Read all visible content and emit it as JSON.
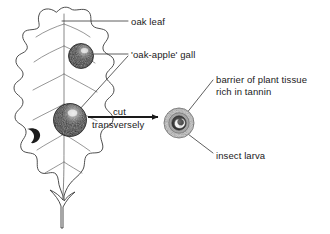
{
  "diagram": {
    "type": "biology-labelled-diagram",
    "background_color": "#ffffff",
    "ink_color": "#1a1a1a"
  },
  "labels": {
    "oak_leaf": "oak leaf",
    "gall": "'oak-apple' gall",
    "barrier_line1": "barrier of plant tissue",
    "barrier_line2": "rich in tannin",
    "insect_larva": "insect larva",
    "cut": "cut",
    "transversely": "transversely"
  },
  "parts": {
    "leaf": {
      "name": "oak leaf",
      "outline_color": "#3a3a3a",
      "fill_color": "#ffffff",
      "vein_color": "#6a6a6a",
      "lobe_count": 6
    },
    "gall_upper": {
      "name": "oak-apple gall (upper)",
      "center_x": 81,
      "center_y": 56,
      "radius": 12,
      "fill_color": "#1c1c1c",
      "highlight_color": "#f0f0f0"
    },
    "gall_lower": {
      "name": "oak-apple gall (lower)",
      "center_x": 70,
      "center_y": 120,
      "radius": 16,
      "fill_color": "#1c1c1c",
      "highlight_color": "#f2f2f2"
    },
    "leaf_blemish": {
      "name": "dark blemish on lower-left lobe",
      "fill_color": "#1c1c1c"
    },
    "cross_section": {
      "name": "transverse section of gall",
      "center_x": 179,
      "center_y": 123,
      "outer_radius": 15,
      "outer_ring_color": "#d2d2d2",
      "mid_ring_color": "#9a9a9a",
      "inner_core_color": "#4a4a4a",
      "larva_color": "#f4f4f4"
    },
    "arrow": {
      "name": "cut-transversely arrow",
      "x_start": 88,
      "x_end": 160,
      "y": 117,
      "color": "#1a1a1a"
    }
  },
  "leader_lines": [
    {
      "name": "leader-oak-leaf",
      "from": [
        128,
        21
      ],
      "to": [
        62,
        21
      ]
    },
    {
      "name": "leader-gall-upper",
      "from": [
        128,
        54
      ],
      "to": [
        93,
        54
      ]
    },
    {
      "name": "leader-gall-lower",
      "from": [
        128,
        56
      ],
      "to": [
        78,
        110
      ]
    },
    {
      "name": "leader-barrier",
      "from": [
        213,
        80
      ],
      "to": [
        186,
        114
      ]
    },
    {
      "name": "leader-larva",
      "from": [
        213,
        153
      ],
      "to": [
        184,
        131
      ]
    }
  ]
}
